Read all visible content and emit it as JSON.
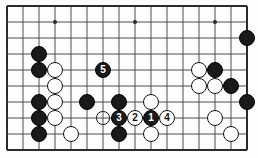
{
  "figure": {
    "kind": "go-board-diagram",
    "title": "",
    "board": {
      "cols": 16,
      "rows": 10,
      "origin_x": 7,
      "origin_y": 6,
      "spacing": 16,
      "line_color": "#4c4c4c",
      "edge_color": "#2b2b2b",
      "background_color": "#fdfdfd",
      "stone_radius": 8.2,
      "star_points": [
        {
          "col": 3,
          "row": 1
        },
        {
          "col": 8,
          "row": 1
        },
        {
          "col": 13,
          "row": 1
        },
        {
          "col": 13,
          "row": 7
        }
      ]
    },
    "colors": {
      "black_stone": "#1a1a1a",
      "white_stone": "#ffffff",
      "stone_outline": "#141414",
      "label_on_black": "#ffffff",
      "label_on_white": "#111111"
    },
    "stones": [
      {
        "id": "b-c15-r2",
        "col": 15,
        "row": 2,
        "color": "black",
        "label": ""
      },
      {
        "id": "b-c2-r3",
        "col": 2,
        "row": 3,
        "color": "black",
        "label": ""
      },
      {
        "id": "b-c2-r4",
        "col": 2,
        "row": 4,
        "color": "black",
        "label": ""
      },
      {
        "id": "w-c3-r4",
        "col": 3,
        "row": 4,
        "color": "white",
        "label": ""
      },
      {
        "id": "w-c3-r5",
        "col": 3,
        "row": 5,
        "color": "white",
        "label": ""
      },
      {
        "id": "b-c6-r4",
        "col": 6,
        "row": 4,
        "color": "black",
        "label": "5"
      },
      {
        "id": "w-c12-r4",
        "col": 12,
        "row": 4,
        "color": "white",
        "label": ""
      },
      {
        "id": "b-c13-r4",
        "col": 13,
        "row": 4,
        "color": "black",
        "label": ""
      },
      {
        "id": "w-c12-r5",
        "col": 12,
        "row": 5,
        "color": "white",
        "label": ""
      },
      {
        "id": "w-c13-r5",
        "col": 13,
        "row": 5,
        "color": "white",
        "label": ""
      },
      {
        "id": "b-c14-r5",
        "col": 14,
        "row": 5,
        "color": "black",
        "label": ""
      },
      {
        "id": "b-c2-r6",
        "col": 2,
        "row": 6,
        "color": "black",
        "label": ""
      },
      {
        "id": "w-c3-r6",
        "col": 3,
        "row": 6,
        "color": "white",
        "label": ""
      },
      {
        "id": "b-c5-r6",
        "col": 5,
        "row": 6,
        "color": "black",
        "label": ""
      },
      {
        "id": "b-c7-r6",
        "col": 7,
        "row": 6,
        "color": "black",
        "label": ""
      },
      {
        "id": "w-c9-r6",
        "col": 9,
        "row": 6,
        "color": "white",
        "label": ""
      },
      {
        "id": "b-c15-r6",
        "col": 15,
        "row": 6,
        "color": "black",
        "label": ""
      },
      {
        "id": "b-c2-r7",
        "col": 2,
        "row": 7,
        "color": "black",
        "label": ""
      },
      {
        "id": "w-c3-r7",
        "col": 3,
        "row": 7,
        "color": "white",
        "label": ""
      },
      {
        "id": "b-c7-r7",
        "col": 7,
        "row": 7,
        "color": "black",
        "label": "3"
      },
      {
        "id": "w-c8-r7",
        "col": 8,
        "row": 7,
        "color": "white",
        "label": "2"
      },
      {
        "id": "b-c9-r7",
        "col": 9,
        "row": 7,
        "color": "black",
        "label": "1"
      },
      {
        "id": "w-c10-r7",
        "col": 10,
        "row": 7,
        "color": "white",
        "label": "4"
      },
      {
        "id": "w-c13-r7",
        "col": 13,
        "row": 7,
        "color": "white",
        "label": ""
      },
      {
        "id": "b-c2-r8",
        "col": 2,
        "row": 8,
        "color": "black",
        "label": ""
      },
      {
        "id": "w-c4-r8",
        "col": 4,
        "row": 8,
        "color": "white",
        "label": ""
      },
      {
        "id": "b-c7-r8",
        "col": 7,
        "row": 8,
        "color": "black",
        "label": ""
      },
      {
        "id": "w-c9-r8",
        "col": 9,
        "row": 8,
        "color": "white",
        "label": ""
      },
      {
        "id": "w-c14-r8",
        "col": 14,
        "row": 8,
        "color": "white",
        "label": ""
      }
    ],
    "markers": [
      {
        "id": "ring-c6-r7",
        "col": 6,
        "row": 7,
        "shape": "circle-outline"
      }
    ],
    "move_numbers": [
      {
        "number": "1",
        "color": "black",
        "col": 9,
        "row": 7
      },
      {
        "number": "2",
        "color": "white",
        "col": 8,
        "row": 7
      },
      {
        "number": "3",
        "color": "black",
        "col": 7,
        "row": 7
      },
      {
        "number": "4",
        "color": "white",
        "col": 10,
        "row": 7
      },
      {
        "number": "5",
        "color": "black",
        "col": 6,
        "row": 4
      }
    ]
  }
}
